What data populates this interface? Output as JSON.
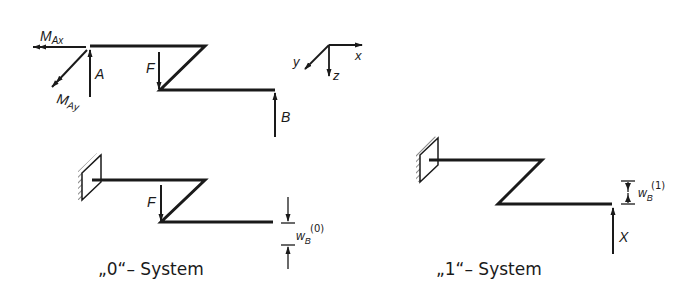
{
  "diagram": {
    "top_system": {
      "labels": {
        "moment_x": "M",
        "moment_x_sub": "Ax",
        "moment_y": "M",
        "moment_y_sub": "Ay",
        "reaction_a": "A",
        "force": "F",
        "reaction_b": "B"
      }
    },
    "axes": {
      "x": "x",
      "y": "y",
      "z": "z"
    },
    "system_0": {
      "caption": "„0“– System",
      "force": "F",
      "deflection": "w",
      "deflection_sub": "B",
      "deflection_sup": "(0)"
    },
    "system_1": {
      "caption": "„1“– System",
      "deflection": "w",
      "deflection_sub": "B",
      "deflection_sup": "(1)",
      "redundant": "X"
    },
    "colors": {
      "line": "#1a1a1a",
      "background": "#ffffff"
    }
  }
}
